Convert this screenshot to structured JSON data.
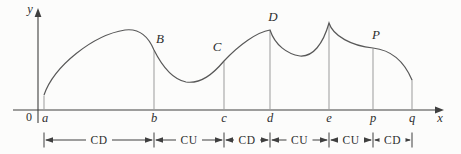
{
  "figure": {
    "colors": {
      "background": "#fcfcfb",
      "axis": "#3f3f3f",
      "curve": "#585858",
      "guide": "#9b9b9b",
      "text": "#2e2e2e"
    },
    "axis_labels": {
      "y": "y",
      "x": "x",
      "origin": "0"
    },
    "x_ticks": [
      {
        "label": "a"
      },
      {
        "label": "b"
      },
      {
        "label": "c"
      },
      {
        "label": "d"
      },
      {
        "label": "e"
      },
      {
        "label": "p"
      },
      {
        "label": "q"
      }
    ],
    "points": [
      {
        "label": "B",
        "at": "b"
      },
      {
        "label": "C",
        "at": "c"
      },
      {
        "label": "D",
        "at": "d"
      },
      {
        "label": "P",
        "at": "p"
      }
    ],
    "intervals": [
      {
        "from": "a",
        "to": "b",
        "label": "CD"
      },
      {
        "from": "b",
        "to": "c",
        "label": "CU"
      },
      {
        "from": "c",
        "to": "d",
        "label": "CD"
      },
      {
        "from": "d",
        "to": "e",
        "label": "CU"
      },
      {
        "from": "e",
        "to": "p",
        "label": "CU"
      },
      {
        "from": "p",
        "to": "q",
        "label": "CD"
      }
    ]
  }
}
